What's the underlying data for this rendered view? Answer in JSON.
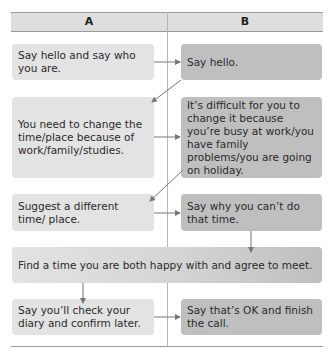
{
  "columns": [
    {
      "label": "A"
    },
    {
      "label": "B"
    }
  ],
  "steps": [
    {
      "id": "a1",
      "column": "A",
      "text": "Say hello and say who you are."
    },
    {
      "id": "b1",
      "column": "B",
      "text": "Say hello."
    },
    {
      "id": "a2",
      "column": "A",
      "text": "You need to change the time/place because of work/family/studies."
    },
    {
      "id": "b2",
      "column": "B",
      "text": "It’s difficult for you to change it because you’re busy at work/you have family problems/you are going on holiday."
    },
    {
      "id": "a3",
      "column": "A",
      "text": "Suggest a different time/ place."
    },
    {
      "id": "b3",
      "column": "B",
      "text": "Say why you can’t do that time."
    },
    {
      "id": "ab4",
      "column": "A+B",
      "text": "Find a time you are both happy with and agree to meet."
    },
    {
      "id": "a5",
      "column": "A",
      "text": "Say you’ll check your diary and confirm later."
    },
    {
      "id": "b5",
      "column": "B",
      "text": "Say that’s OK and finish the call."
    }
  ],
  "flow": [
    [
      "a1",
      "b1"
    ],
    [
      "b1",
      "a2"
    ],
    [
      "a2",
      "b2"
    ],
    [
      "b2",
      "a3"
    ],
    [
      "a3",
      "b3"
    ],
    [
      "b3",
      "ab4"
    ],
    [
      "ab4",
      "a5"
    ],
    [
      "a5",
      "b5"
    ]
  ],
  "colors": {
    "header_bg": "#dedede",
    "column_a_box": "#e3e3e3",
    "column_b_box": "#bfbfbf",
    "arrow": "#777777"
  }
}
